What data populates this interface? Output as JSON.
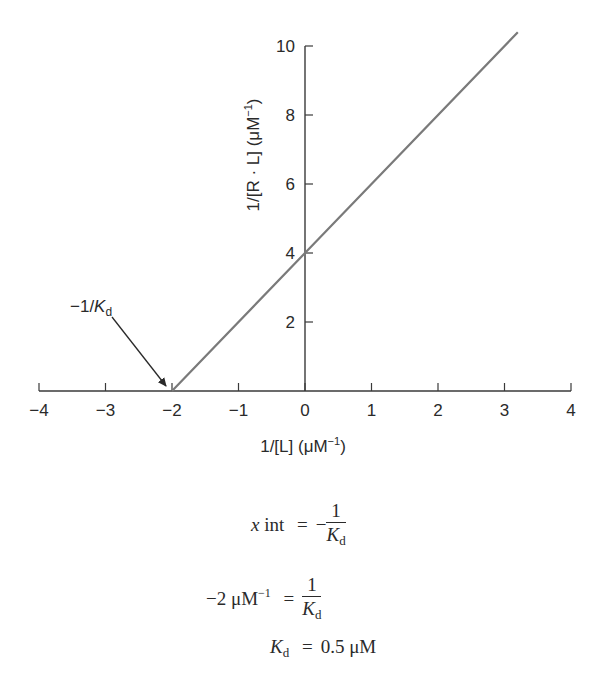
{
  "chart_data": {
    "type": "line",
    "title": "",
    "xlabel": "1/[L] (μM⁻¹)",
    "ylabel": "1/[R · L] (μM⁻¹)",
    "xlim": [
      -4,
      4
    ],
    "ylim": [
      0,
      10
    ],
    "x_ticks": [
      -4,
      -3,
      -2,
      -1,
      0,
      1,
      2,
      3,
      4
    ],
    "x_tick_labels": [
      "−4",
      "−3",
      "−2",
      "−1",
      "0",
      "1",
      "2",
      "3",
      "4"
    ],
    "y_ticks": [
      2,
      4,
      6,
      8,
      10
    ],
    "y_tick_labels": [
      "2",
      "4",
      "6",
      "8",
      "10"
    ],
    "grid": false,
    "legend": null,
    "series": [
      {
        "name": "Double-reciprocal binding line",
        "x": [
          -2,
          0,
          3.2
        ],
        "y": [
          0,
          4,
          10.4
        ],
        "slope": 2,
        "y_intercept": 4,
        "x_intercept": -2,
        "color": "#7a7a7a"
      }
    ],
    "annotations": [
      {
        "text": "−1/K",
        "subscript": "d",
        "points_to": {
          "x": -2,
          "y": 0
        }
      }
    ]
  },
  "axis_labels": {
    "x_main": "1/[L] (μM",
    "x_sup": "−1",
    "x_close": ")",
    "y_main": "1/[R · L] (μM",
    "y_sup": "−1",
    "y_close": ")"
  },
  "annotation": {
    "prefix": "−1/",
    "var": "K",
    "sub": "d"
  },
  "equations": {
    "eq1": {
      "lhs_var": "x",
      "lhs_rest": " int",
      "equals": "=",
      "minus": "−",
      "num": "1",
      "den_var": "K",
      "den_sub": "d"
    },
    "eq2": {
      "lhs": "−2 μM",
      "lhs_sup": "−1",
      "equals": "=",
      "num": "1",
      "den_var": "K",
      "den_sub": "d"
    },
    "eq3": {
      "lhs_var": "K",
      "lhs_sub": "d",
      "equals": "=",
      "rhs": "0.5 μM"
    }
  },
  "colors": {
    "axis": "#3a3a3a",
    "line": "#7a7a7a",
    "text": "#2a2a2a"
  }
}
